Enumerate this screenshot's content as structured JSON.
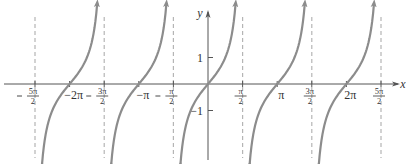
{
  "chart_data": {
    "type": "line",
    "title": "",
    "function": "y = tan x",
    "xlabel": "x",
    "ylabel": "y",
    "xlim": [
      -8.4,
      8.4
    ],
    "ylim": [
      -3.2,
      3.2
    ],
    "grid": false,
    "legend": null,
    "x_ticks": [
      {
        "value": -7.854,
        "label": "-5π/2",
        "num": "5π",
        "den": "2",
        "neg": true
      },
      {
        "value": -6.283,
        "label": "-2π",
        "text": "−2π"
      },
      {
        "value": -4.712,
        "label": "-3π/2",
        "num": "3π",
        "den": "2",
        "neg": true
      },
      {
        "value": -3.1416,
        "label": "-π",
        "text": "−π"
      },
      {
        "value": -1.5708,
        "label": "-π/2",
        "num": "π",
        "den": "2",
        "neg": true
      },
      {
        "value": 1.5708,
        "label": "π/2",
        "num": "π",
        "den": "2",
        "neg": false
      },
      {
        "value": 3.1416,
        "label": "π",
        "text": "π"
      },
      {
        "value": 4.712,
        "label": "3π/2",
        "num": "3π",
        "den": "2",
        "neg": false
      },
      {
        "value": 6.283,
        "label": "2π",
        "text": "2π"
      },
      {
        "value": 7.854,
        "label": "5π/2",
        "num": "5π",
        "den": "2",
        "neg": false
      }
    ],
    "y_ticks": [
      {
        "value": 1,
        "label": "1"
      },
      {
        "value": -1,
        "label": "−1"
      }
    ],
    "asymptotes": [
      -7.854,
      -4.712,
      -1.5708,
      1.5708,
      4.712,
      7.854
    ],
    "branches": [
      {
        "center": -6.2832,
        "from": -7.854,
        "to": -4.712
      },
      {
        "center": -3.1416,
        "from": -4.712,
        "to": -1.5708
      },
      {
        "center": 0,
        "from": -1.5708,
        "to": 1.5708
      },
      {
        "center": 3.1416,
        "from": 1.5708,
        "to": 4.712
      },
      {
        "center": 6.2832,
        "from": 4.712,
        "to": 7.854
      }
    ],
    "sample_points": [
      {
        "x": -1.25,
        "y": -3.0
      },
      {
        "x": -0.785,
        "y": -1
      },
      {
        "x": 0,
        "y": 0
      },
      {
        "x": 0.785,
        "y": 1
      },
      {
        "x": 1.25,
        "y": 3.0
      }
    ],
    "colors": {
      "curve": "#8c8c8c",
      "axis": "#555555",
      "asymptote": "#b5b5b5",
      "text": "#333333"
    }
  },
  "labels": {
    "x_axis": "x",
    "y_axis": "y"
  }
}
